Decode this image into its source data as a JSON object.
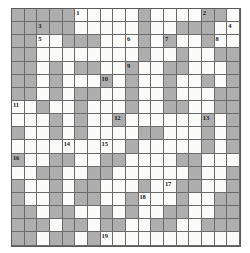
{
  "puzzle": {
    "type": "crossword-grid",
    "rows": 18,
    "columns": 18,
    "cell_size_px": 12.7,
    "colors": {
      "open_cell": "#fbfbfa",
      "blocked_cell": "#aeaeae",
      "grid_line": "#6b6b6b",
      "number_text": "#1a1a1a"
    },
    "clue_numbers_visible": [
      1,
      2,
      3,
      4,
      5,
      6,
      7,
      8,
      9,
      10,
      11,
      12,
      13,
      14,
      15,
      16,
      17,
      18,
      19
    ],
    "clue_number_count": 19,
    "grid": [
      "BBBBB.....B....BB",
      "BBBBB.....B..BBB.",
      "BB..BBB...B.B..B.",
      "BB.........B..B..",
      "BB.B.BB..B..BB...",
      "BB.B...B.B..B..B.",
      "BB.B.BB..B..B...B",
      "..B..B...B..BB..B",
      "...B.B..B......B.",
      "B..B.B....BB...B.",
      ".........B.....B.",
      "B..BB..BB...BB...",
      "..BB..BB......B..",
      "B..B.BB...B..BB..",
      "B..B.BB..B...B..B",
      "BB.BB..B.B..BB..B",
      "BBB.BB.BB..BB..BB",
      "BB.BB.B.........."
    ]
  }
}
